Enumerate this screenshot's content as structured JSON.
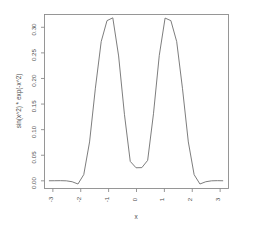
{
  "chart_data": {
    "type": "line",
    "title": "",
    "xlabel": "x",
    "ylabel": "sin(x^2) * exp(-x^2)",
    "xlim": [
      -3.3,
      3.3
    ],
    "ylim": [
      -0.015,
      0.325
    ],
    "grid": false,
    "legend": null,
    "line_color": "#6e6e6e",
    "frame_color": "#8c8c8c",
    "background": "#ffffff",
    "xticks": [
      -3,
      -2,
      -1,
      0,
      1,
      2,
      3
    ],
    "xtick_labels": [
      "-3",
      "-2",
      "-1",
      "0",
      "1",
      "2",
      "3"
    ],
    "yticks": [
      0.0,
      0.05,
      0.1,
      0.15,
      0.2,
      0.25,
      0.3
    ],
    "ytick_labels": [
      "0.00",
      "0.05",
      "0.10",
      "0.15",
      "0.20",
      "0.25",
      "0.30"
    ],
    "x": [
      -3.1416,
      -2.9333,
      -2.7249,
      -2.5166,
      -2.3082,
      -2.0999,
      -1.8915,
      -1.6832,
      -1.4748,
      -1.2665,
      -1.0581,
      -0.8498,
      -0.6414,
      -0.4331,
      -0.2247,
      -0.0164,
      0.192,
      0.4003,
      0.6087,
      0.817,
      1.0254,
      1.2337,
      1.4421,
      1.6504,
      1.8588,
      2.0671,
      2.2755,
      2.4838,
      2.6922,
      2.9005,
      3.1089
    ],
    "y": [
      0.0001,
      0.0002,
      0.0003,
      0.0,
      -0.0018,
      -0.0062,
      0.0122,
      0.076,
      0.181,
      0.272,
      0.313,
      0.3185,
      0.244,
      0.13,
      0.038,
      0.0255,
      0.0258,
      0.04,
      0.131,
      0.245,
      0.318,
      0.313,
      0.272,
      0.18,
      0.076,
      0.012,
      -0.0062,
      -0.0018,
      0.0,
      0.0003,
      0.0001
    ],
    "ytick_label_rotation": -90,
    "xtick_label_rotation": -90
  },
  "axes": {
    "x_axis_name": "x-axis",
    "y_axis_name": "y-axis"
  }
}
